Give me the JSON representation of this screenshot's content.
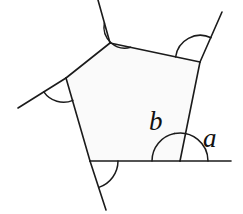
{
  "figure": {
    "kind": "geometry-diagram",
    "background_color": "#ffffff",
    "stroke_color": "#1b1b1b",
    "fill_color": "#fafafa",
    "labels": [
      {
        "id": "b",
        "text": "b",
        "meaning": "interior-angle",
        "x": 149,
        "y": 108
      },
      {
        "id": "a",
        "text": "a",
        "meaning": "exterior-angle",
        "x": 203,
        "y": 125
      }
    ],
    "vertices": [
      {
        "id": "top",
        "x": 110,
        "y": 43
      },
      {
        "id": "upper-right",
        "x": 200,
        "y": 62
      },
      {
        "id": "bottom-right",
        "x": 180,
        "y": 161
      },
      {
        "id": "bottom-left",
        "x": 90,
        "y": 161
      },
      {
        "id": "left",
        "x": 66,
        "y": 78
      }
    ],
    "polygon_path": "M110,43 L200,62 L180,161 L90,161 L66,78 Z",
    "edges": [
      {
        "id": "edge-top-right",
        "from": "top",
        "to": "upper-right"
      },
      {
        "id": "edge-right",
        "from": "upper-right",
        "to": "bottom-right"
      },
      {
        "id": "edge-bottom",
        "from": "bottom-right",
        "to": "bottom-left"
      },
      {
        "id": "edge-lower-left",
        "from": "bottom-left",
        "to": "left"
      },
      {
        "id": "edge-upper-left",
        "from": "left",
        "to": "top"
      }
    ],
    "extension_rays": [
      {
        "id": "ray-top",
        "from_vertex": "top",
        "path": "M110,43 L98,0"
      },
      {
        "id": "ray-upper-right",
        "from_vertex": "upper-right",
        "path": "M200,62 L222,12"
      },
      {
        "id": "ray-horizontal",
        "from_vertex": "bottom-right",
        "path": "M180,161 L231,161"
      },
      {
        "id": "ray-bottom",
        "from_vertex": "bottom-left",
        "path": "M90,161 L106,210"
      },
      {
        "id": "ray-left",
        "from_vertex": "left",
        "path": "M66,78 L18,108"
      }
    ],
    "angle_arcs": [
      {
        "id": "arc-top",
        "at_vertex": "top",
        "type": "exterior"
      },
      {
        "id": "arc-upper-right",
        "at_vertex": "upper-right",
        "type": "exterior"
      },
      {
        "id": "arc-left",
        "at_vertex": "left",
        "type": "exterior"
      },
      {
        "id": "arc-bottom-left",
        "at_vertex": "bottom-left",
        "type": "exterior"
      },
      {
        "id": "arc-interior-b",
        "at_vertex": "bottom-right",
        "type": "interior",
        "label": "b"
      },
      {
        "id": "arc-exterior-a",
        "at_vertex": "bottom-right",
        "type": "exterior",
        "label": "a"
      }
    ]
  }
}
